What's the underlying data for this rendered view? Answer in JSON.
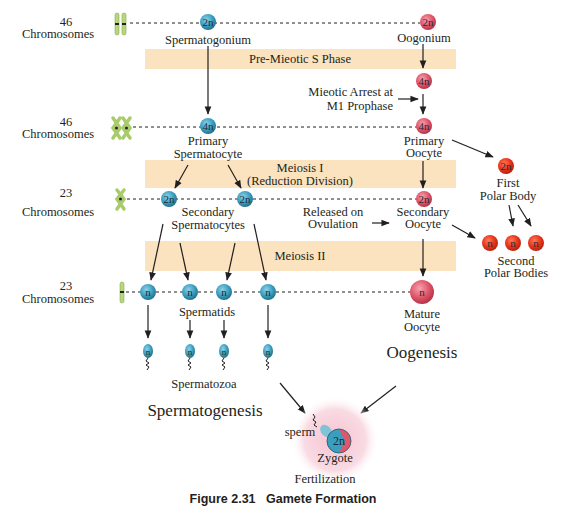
{
  "figure": {
    "caption": "Figure 2.31   Gamete Formation",
    "colors": {
      "band": "#fbe3bf",
      "male_cell": "#3a9fbf",
      "female_cell": "#e0566a",
      "polar_body": "#e8341c",
      "chromosome": "#b7d77a",
      "zygote_glow": "#f7cdd8"
    },
    "rows": [
      {
        "count": "46",
        "unit": "Chromosomes",
        "chromosome_icon": "unreplicated-pair-icon"
      },
      {
        "count": "46",
        "unit": "Chromosomes",
        "chromosome_icon": "replicated-pair-icon"
      },
      {
        "count": "23",
        "unit": "Chromosomes",
        "chromosome_icon": "replicated-single-icon"
      },
      {
        "count": "23",
        "unit": "Chromosomes",
        "chromosome_icon": "unreplicated-single-icon"
      }
    ],
    "bands": {
      "pre_meiotic": "Pre-Mieotic S Phase",
      "meiosis1_line1": "Meiosis I",
      "meiosis1_line2": "(Reduction Division)",
      "meiosis2": "Meiosis II"
    },
    "spermatogenesis": {
      "title": "Spermatogenesis",
      "spermatogonium": {
        "label": "Spermatogonium",
        "ploidy": "2n"
      },
      "primary": {
        "label_line1": "Primary",
        "label_line2": "Spermatocyte",
        "ploidy": "4n"
      },
      "secondary": {
        "label_line1": "Secondary",
        "label_line2": "Spermatocytes",
        "ploidy": "2n"
      },
      "spermatids": {
        "label": "Spermatids",
        "ploidy": "n"
      },
      "spermatozoa": {
        "label": "Spermatozoa",
        "ploidy": "n"
      }
    },
    "oogenesis": {
      "title": "Oogenesis",
      "oogonium": {
        "label": "Oogonium",
        "ploidy": "2n"
      },
      "arrested": {
        "ploidy": "4n",
        "note_line1": "Mieotic Arrest at",
        "note_line2": "M1 Prophase"
      },
      "primary": {
        "label_line1": "Primary",
        "label_line2": "Oocyte",
        "ploidy": "4n"
      },
      "secondary": {
        "label_line1": "Secondary",
        "label_line2": "Oocyte",
        "ploidy": "2n",
        "note_line1": "Released on",
        "note_line2": "Ovulation"
      },
      "mature": {
        "label_line1": "Mature",
        "label_line2": "Oocyte",
        "ploidy": "n"
      },
      "first_polar_body": {
        "label_line1": "First",
        "label_line2": "Polar Body",
        "ploidy": "2n"
      },
      "second_polar_bodies": {
        "label_line1": "Second",
        "label_line2": "Polar Bodies",
        "ploidy": "n"
      }
    },
    "fertilization": {
      "label": "Fertilization",
      "zygote": {
        "label": "Zygote",
        "ploidy": "2n"
      },
      "sperm_label": "sperm"
    }
  }
}
